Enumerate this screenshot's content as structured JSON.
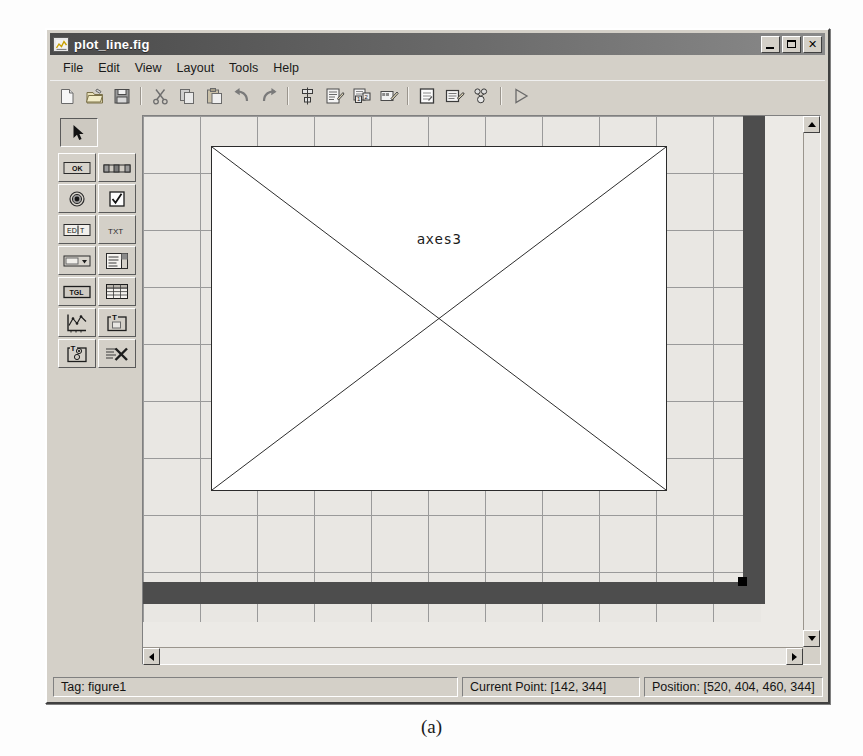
{
  "window": {
    "title": "plot_line.fig",
    "icon": "matlab-figure-icon",
    "controls": {
      "minimize": "minimize-button",
      "maximize": "maximize-button",
      "close_label": "✕"
    }
  },
  "menubar": {
    "items": [
      {
        "label": "File",
        "name": "menu-file"
      },
      {
        "label": "Edit",
        "name": "menu-edit"
      },
      {
        "label": "View",
        "name": "menu-view"
      },
      {
        "label": "Layout",
        "name": "menu-layout"
      },
      {
        "label": "Tools",
        "name": "menu-tools"
      },
      {
        "label": "Help",
        "name": "menu-help"
      }
    ]
  },
  "toolbar": {
    "groups": [
      [
        "new-file-icon",
        "open-folder-icon",
        "save-disk-icon"
      ],
      [
        "cut-scissors-icon",
        "copy-icon",
        "paste-icon",
        "undo-arrow-icon",
        "redo-arrow-icon"
      ],
      [
        "align-objects-icon",
        "menu-editor-icon",
        "tab-order-editor-icon",
        "toolbar-editor-icon"
      ],
      [
        "m-file-editor-icon",
        "property-inspector-icon",
        "object-browser-icon"
      ],
      [
        "run-figure-icon"
      ]
    ]
  },
  "palette": {
    "selected_tool": "select-arrow-tool",
    "tools": [
      {
        "name": "push-button-tool",
        "glyph": "OK"
      },
      {
        "name": "slider-tool",
        "glyph": "slider"
      },
      {
        "name": "radio-button-tool",
        "glyph": "radio"
      },
      {
        "name": "checkbox-tool",
        "glyph": "check"
      },
      {
        "name": "edit-text-tool",
        "glyph": "EDIT"
      },
      {
        "name": "static-text-tool",
        "glyph": "TXT"
      },
      {
        "name": "popup-menu-tool",
        "glyph": "popup"
      },
      {
        "name": "listbox-tool",
        "glyph": "list"
      },
      {
        "name": "toggle-button-tool",
        "glyph": "TGL"
      },
      {
        "name": "table-tool",
        "glyph": "table"
      },
      {
        "name": "axes-tool",
        "glyph": "axes"
      },
      {
        "name": "panel-tool",
        "glyph": "panel"
      },
      {
        "name": "button-group-tool",
        "glyph": "buttongroup"
      },
      {
        "name": "activex-control-tool",
        "glyph": "activex"
      }
    ]
  },
  "canvas": {
    "axes_label": "axes3",
    "grid_visible": true
  },
  "statusbar": {
    "tag": "Tag: figure1",
    "current_point": "Current Point:  [142, 344]",
    "position": "Position: [520, 404, 460, 344]"
  },
  "caption": "(a)"
}
